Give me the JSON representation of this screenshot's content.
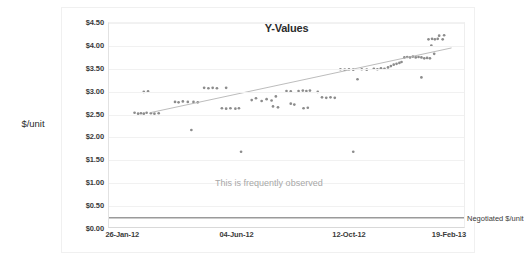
{
  "chart_data": {
    "type": "scatter",
    "title": "Y-Values",
    "xlabel": "",
    "ylabel": "$/unit",
    "grid": true,
    "legend_position": "inline-right",
    "ylim": [
      0,
      4.5
    ],
    "ytick_labels": [
      "$0.00",
      "$0.50",
      "$1.00",
      "$1.50",
      "$2.00",
      "$2.50",
      "$3.00",
      "$3.50",
      "$4.00",
      "$4.50"
    ],
    "ytick_values": [
      0,
      0.5,
      1.0,
      1.5,
      2.0,
      2.5,
      3.0,
      3.5,
      4.0,
      4.5
    ],
    "xtick_labels": [
      "26-Jan-12",
      "04-Jun-12",
      "12-Oct-12",
      "19-Feb-13"
    ],
    "xtick_positions": [
      0.04,
      0.36,
      0.675,
      0.955
    ],
    "series": [
      {
        "name": "Observed $/unit",
        "type": "scatter",
        "color": "#8c8c8c",
        "points": [
          [
            0.072,
            2.52
          ],
          [
            0.082,
            2.5
          ],
          [
            0.09,
            2.51
          ],
          [
            0.098,
            2.5
          ],
          [
            0.106,
            2.52
          ],
          [
            0.118,
            2.51
          ],
          [
            0.128,
            2.5
          ],
          [
            0.14,
            2.51
          ],
          [
            0.098,
            2.98
          ],
          [
            0.11,
            2.99
          ],
          [
            0.186,
            2.76
          ],
          [
            0.196,
            2.75
          ],
          [
            0.208,
            2.77
          ],
          [
            0.222,
            2.76
          ],
          [
            0.238,
            2.76
          ],
          [
            0.25,
            2.75
          ],
          [
            0.232,
            2.14
          ],
          [
            0.268,
            3.07
          ],
          [
            0.28,
            3.06
          ],
          [
            0.292,
            3.07
          ],
          [
            0.304,
            3.06
          ],
          [
            0.33,
            3.07
          ],
          [
            0.318,
            2.62
          ],
          [
            0.33,
            2.61
          ],
          [
            0.342,
            2.62
          ],
          [
            0.356,
            2.61
          ],
          [
            0.366,
            2.62
          ],
          [
            0.372,
            1.66
          ],
          [
            0.402,
            2.8
          ],
          [
            0.414,
            2.84
          ],
          [
            0.43,
            2.78
          ],
          [
            0.444,
            2.82
          ],
          [
            0.458,
            2.79
          ],
          [
            0.47,
            2.88
          ],
          [
            0.462,
            2.66
          ],
          [
            0.476,
            2.64
          ],
          [
            0.5,
            3.0
          ],
          [
            0.512,
            2.99
          ],
          [
            0.534,
            3.0
          ],
          [
            0.546,
            3.01
          ],
          [
            0.556,
            3.0
          ],
          [
            0.566,
            3.01
          ],
          [
            0.588,
            2.98
          ],
          [
            0.512,
            2.72
          ],
          [
            0.522,
            2.7
          ],
          [
            0.548,
            2.62
          ],
          [
            0.56,
            2.63
          ],
          [
            0.6,
            2.86
          ],
          [
            0.612,
            2.85
          ],
          [
            0.624,
            2.86
          ],
          [
            0.636,
            2.85
          ],
          [
            0.652,
            3.48
          ],
          [
            0.664,
            3.47
          ],
          [
            0.676,
            3.48
          ],
          [
            0.688,
            3.47
          ],
          [
            0.712,
            3.48
          ],
          [
            0.726,
            3.47
          ],
          [
            0.746,
            3.49
          ],
          [
            0.756,
            3.48
          ],
          [
            0.766,
            3.5
          ],
          [
            0.776,
            3.49
          ],
          [
            0.786,
            3.52
          ],
          [
            0.794,
            3.55
          ],
          [
            0.802,
            3.58
          ],
          [
            0.81,
            3.6
          ],
          [
            0.818,
            3.62
          ],
          [
            0.824,
            3.64
          ],
          [
            0.832,
            3.74
          ],
          [
            0.84,
            3.75
          ],
          [
            0.848,
            3.74
          ],
          [
            0.856,
            3.76
          ],
          [
            0.864,
            3.74
          ],
          [
            0.872,
            3.75
          ],
          [
            0.88,
            3.74
          ],
          [
            0.888,
            3.72
          ],
          [
            0.896,
            3.73
          ],
          [
            0.904,
            3.72
          ],
          [
            0.7,
            3.26
          ],
          [
            0.688,
            1.66
          ],
          [
            0.88,
            3.3
          ],
          [
            0.9,
            4.14
          ],
          [
            0.91,
            4.15
          ],
          [
            0.918,
            4.14
          ],
          [
            0.926,
            4.15
          ],
          [
            0.94,
            4.14
          ],
          [
            0.908,
            4.0
          ],
          [
            0.93,
            4.22
          ],
          [
            0.944,
            4.23
          ],
          [
            0.916,
            3.82
          ]
        ]
      },
      {
        "name": "Trendline",
        "type": "line",
        "color": "#b4b4b4",
        "x_start": 0.115,
        "y_start": 2.52,
        "x_end": 0.965,
        "y_end": 3.95
      },
      {
        "name": "Negotiated $/unit",
        "type": "hline",
        "color": "#9a9a9a",
        "value": 0.205,
        "label": "Negotiated $/unit"
      }
    ],
    "annotations": [
      {
        "text": "This is frequently observed",
        "x": 0.3,
        "y": 0.95,
        "color": "#a8a8a8"
      }
    ]
  }
}
